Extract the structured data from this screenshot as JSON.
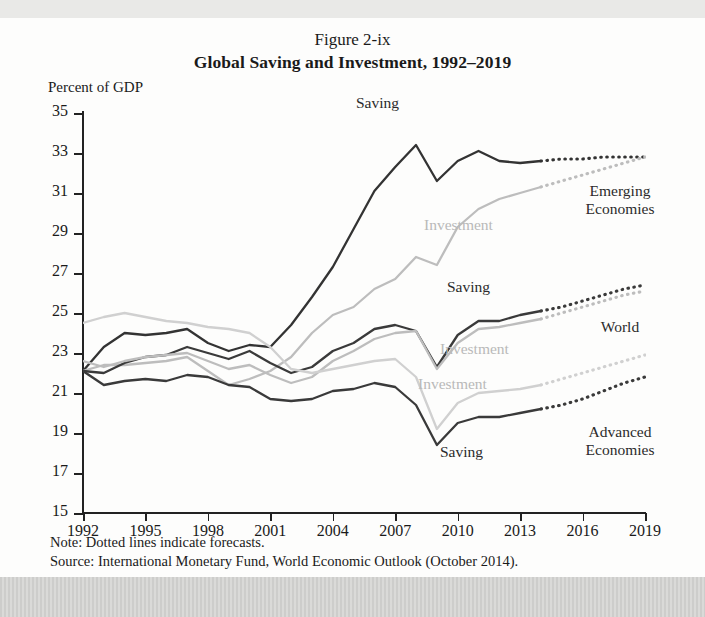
{
  "figure": {
    "number": "Figure 2-ix",
    "title": "Global Saving and Investment, 1992–2019",
    "y_axis_label": "Percent of GDP",
    "note": "Note: Dotted lines indicate forecasts.",
    "source": "Source: International Monetary Fund, World Economic Outlook (October 2014)."
  },
  "group_labels": {
    "emerging_line1": "Emerging",
    "emerging_line2": "Economies",
    "world": "World",
    "advanced_line1": "Advanced",
    "advanced_line2": "Economies"
  },
  "series_labels": {
    "emerging_saving": "Saving",
    "emerging_investment": "Investment",
    "world_saving": "Saving",
    "world_investment": "Investment",
    "advanced_saving": "Saving",
    "advanced_investment": "Investment"
  },
  "colors": {
    "dark": "#333333",
    "mid": "#8c8c8c",
    "light": "#c2c2c2",
    "axis": "#222222"
  },
  "chart_data": {
    "type": "line",
    "title": "Global Saving and Investment, 1992–2019",
    "subtitle": "Figure 2-ix",
    "xlabel": "",
    "ylabel": "Percent of GDP",
    "xlim": [
      1992,
      2019
    ],
    "ylim": [
      15,
      35
    ],
    "ytick_values": [
      15,
      17,
      19,
      21,
      23,
      25,
      27,
      29,
      31,
      33,
      35
    ],
    "xtick_values": [
      1992,
      1995,
      1998,
      2001,
      2004,
      2007,
      2010,
      2013,
      2016,
      2019
    ],
    "grid": false,
    "legend_position": "inline-annotations",
    "forecast_start_year": 2014,
    "x": [
      1992,
      1993,
      1994,
      1995,
      1996,
      1997,
      1998,
      1999,
      2000,
      2001,
      2002,
      2003,
      2004,
      2005,
      2006,
      2007,
      2008,
      2009,
      2010,
      2011,
      2012,
      2013,
      2014,
      2015,
      2016,
      2017,
      2018,
      2019
    ],
    "series": [
      {
        "name": "Emerging Economies Saving",
        "style": "solid-dark",
        "color": "#333333",
        "values": [
          22.1,
          23.3,
          24.0,
          23.9,
          24.0,
          24.2,
          23.5,
          23.1,
          23.4,
          23.3,
          24.4,
          25.8,
          27.3,
          29.2,
          31.1,
          32.3,
          33.4,
          31.6,
          32.6,
          33.1,
          32.6,
          32.5,
          32.6,
          32.7,
          32.7,
          32.8,
          32.8,
          32.8
        ]
      },
      {
        "name": "Emerging Economies Investment",
        "style": "solid-mid",
        "color": "#bdbdbd",
        "values": [
          22.1,
          22.4,
          22.4,
          22.5,
          22.6,
          22.8,
          22.1,
          21.4,
          21.7,
          22.1,
          22.8,
          24.0,
          24.9,
          25.3,
          26.2,
          26.7,
          27.8,
          27.4,
          29.3,
          30.2,
          30.7,
          31.0,
          31.3,
          31.6,
          31.9,
          32.2,
          32.5,
          32.8
        ]
      },
      {
        "name": "World Saving",
        "style": "solid-dark",
        "color": "#3a3a3a",
        "values": [
          22.1,
          22.0,
          22.5,
          22.8,
          22.9,
          23.3,
          23.0,
          22.7,
          23.1,
          22.5,
          22.0,
          22.3,
          23.1,
          23.5,
          24.2,
          24.4,
          24.1,
          22.3,
          23.9,
          24.6,
          24.6,
          24.9,
          25.1,
          25.3,
          25.6,
          25.9,
          26.2,
          26.4
        ]
      },
      {
        "name": "World Investment",
        "style": "solid-light",
        "color": "#bdbdbd",
        "values": [
          22.6,
          22.3,
          22.6,
          22.8,
          22.9,
          23.0,
          22.6,
          22.2,
          22.4,
          21.9,
          21.5,
          21.8,
          22.6,
          23.1,
          23.7,
          24.0,
          24.1,
          22.2,
          23.5,
          24.2,
          24.3,
          24.5,
          24.7,
          25.0,
          25.3,
          25.6,
          25.9,
          26.1
        ]
      },
      {
        "name": "Advanced Economies Saving",
        "style": "solid-dark",
        "color": "#3a3a3a",
        "values": [
          22.1,
          21.4,
          21.6,
          21.7,
          21.6,
          21.9,
          21.8,
          21.4,
          21.3,
          20.7,
          20.6,
          20.7,
          21.1,
          21.2,
          21.5,
          21.3,
          20.4,
          18.4,
          19.5,
          19.8,
          19.8,
          20.0,
          20.2,
          20.4,
          20.7,
          21.1,
          21.5,
          21.8
        ]
      },
      {
        "name": "Advanced Economies Investment",
        "style": "solid-light",
        "color": "#d0d0d0",
        "values": [
          24.5,
          24.8,
          25.0,
          24.8,
          24.6,
          24.5,
          24.3,
          24.2,
          24.0,
          23.3,
          22.2,
          22.0,
          22.2,
          22.4,
          22.6,
          22.7,
          21.8,
          19.2,
          20.5,
          21.0,
          21.1,
          21.2,
          21.4,
          21.7,
          22.0,
          22.3,
          22.6,
          22.9
        ]
      }
    ]
  }
}
